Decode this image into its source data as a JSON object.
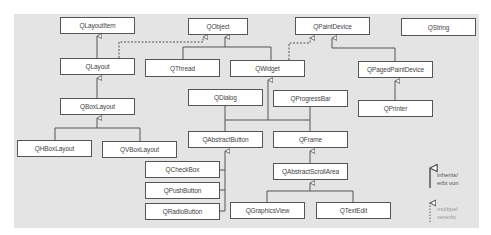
{
  "diagram": {
    "nodes": [
      {
        "id": "QLayoutItem",
        "label": "QLayoutItem"
      },
      {
        "id": "QObject",
        "label": "QObject"
      },
      {
        "id": "QPaintDevice",
        "label": "QPaintDevice"
      },
      {
        "id": "QString",
        "label": "QString"
      },
      {
        "id": "QLayout",
        "label": "QLayout"
      },
      {
        "id": "QThread",
        "label": "QThread"
      },
      {
        "id": "QWidget",
        "label": "QWidget"
      },
      {
        "id": "QPagedPaintDevice",
        "label": "QPagedPaintDevice"
      },
      {
        "id": "QBoxLayout",
        "label": "QBoxLayout"
      },
      {
        "id": "QDialog",
        "label": "QDialog"
      },
      {
        "id": "QProgressBar",
        "label": "QProgressBar"
      },
      {
        "id": "QPrinter",
        "label": "QPrinter"
      },
      {
        "id": "QHBoxLayout",
        "label": "QHBoxLayout"
      },
      {
        "id": "QVBoxLayout",
        "label": "QVBoxLayout"
      },
      {
        "id": "QAbstractButton",
        "label": "QAbstractButton"
      },
      {
        "id": "QFrame",
        "label": "QFrame"
      },
      {
        "id": "QCheckBox",
        "label": "QCheckBox"
      },
      {
        "id": "QAbstractScrollArea",
        "label": "QAbstractScrollArea"
      },
      {
        "id": "QPushButton",
        "label": "QPushButton"
      },
      {
        "id": "QRadioButton",
        "label": "QRadioButton"
      },
      {
        "id": "QGraphicsView",
        "label": "QGraphicsView"
      },
      {
        "id": "QTextEdit",
        "label": "QTextEdit"
      }
    ],
    "edges": [
      {
        "from": "QLayout",
        "to": "QLayoutItem",
        "type": "inherits"
      },
      {
        "from": "QLayout",
        "to": "QObject",
        "type": "multiple"
      },
      {
        "from": "QThread",
        "to": "QObject",
        "type": "inherits"
      },
      {
        "from": "QWidget",
        "to": "QObject",
        "type": "inherits"
      },
      {
        "from": "QWidget",
        "to": "QPaintDevice",
        "type": "multiple"
      },
      {
        "from": "QPagedPaintDevice",
        "to": "QPaintDevice",
        "type": "inherits"
      },
      {
        "from": "QPrinter",
        "to": "QPagedPaintDevice",
        "type": "inherits"
      },
      {
        "from": "QBoxLayout",
        "to": "QLayout",
        "type": "inherits"
      },
      {
        "from": "QHBoxLayout",
        "to": "QBoxLayout",
        "type": "inherits"
      },
      {
        "from": "QVBoxLayout",
        "to": "QBoxLayout",
        "type": "inherits"
      },
      {
        "from": "QDialog",
        "to": "QWidget",
        "type": "inherits"
      },
      {
        "from": "QProgressBar",
        "to": "QWidget",
        "type": "inherits"
      },
      {
        "from": "QAbstractButton",
        "to": "QWidget",
        "type": "inherits"
      },
      {
        "from": "QFrame",
        "to": "QWidget",
        "type": "inherits"
      },
      {
        "from": "QCheckBox",
        "to": "QAbstractButton",
        "type": "inherits"
      },
      {
        "from": "QPushButton",
        "to": "QAbstractButton",
        "type": "inherits"
      },
      {
        "from": "QRadioButton",
        "to": "QAbstractButton",
        "type": "inherits"
      },
      {
        "from": "QAbstractScrollArea",
        "to": "QFrame",
        "type": "inherits"
      },
      {
        "from": "QGraphicsView",
        "to": "QAbstractScrollArea",
        "type": "inherits"
      },
      {
        "from": "QTextEdit",
        "to": "QAbstractScrollArea",
        "type": "inherits"
      }
    ]
  },
  "legend": {
    "inherits_line1": "inherits/",
    "inherits_line2": "erbt von",
    "multiple_line1": "multipel",
    "multiple_line2": "vererbt"
  },
  "colors": {
    "background": "#e4e4e4",
    "node_fill": "#ffffff",
    "line": "#555555",
    "legend_light": "#999999"
  }
}
